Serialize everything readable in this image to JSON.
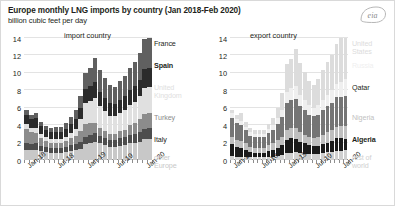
{
  "header": {
    "title": "Europe monthly LNG imports by country (Jan 2018-Feb 2020)",
    "subtitle": "billion cubic feet per day",
    "logo": "eia-logo"
  },
  "chart_data": [
    {
      "id": "imports",
      "type": "bar",
      "stacked": true,
      "title": "import country",
      "xlabel": "",
      "ylabel": "billion cubic feet per day",
      "ylim": [
        0,
        14
      ],
      "yticks": [
        0,
        2,
        4,
        6,
        8,
        10,
        12,
        14
      ],
      "grid": true,
      "legend_position": "right",
      "x": [
        "Jan-18",
        "Feb-18",
        "Mar-18",
        "Apr-18",
        "May-18",
        "Jun-18",
        "Jul-18",
        "Aug-18",
        "Sep-18",
        "Oct-18",
        "Nov-18",
        "Dec-18",
        "Jan-19",
        "Feb-19",
        "Mar-19",
        "Apr-19",
        "May-19",
        "Jun-19",
        "Jul-19",
        "Aug-19",
        "Sep-19",
        "Oct-19",
        "Nov-19",
        "Dec-19",
        "Jan-20",
        "Feb-20"
      ],
      "xtick_labels": [
        "Jan-18",
        "Jul-18",
        "Jan-19",
        "Jul-19",
        "Jan-20"
      ],
      "xtick_index": [
        0,
        6,
        12,
        18,
        24
      ],
      "series": [
        {
          "name": "other Europe",
          "color": "#c8c8c8",
          "values": [
            1.2,
            1.1,
            1.2,
            1.0,
            0.9,
            0.8,
            0.8,
            0.8,
            0.9,
            1.0,
            1.1,
            1.3,
            1.8,
            2.0,
            2.1,
            1.9,
            1.7,
            1.5,
            1.5,
            1.6,
            1.7,
            1.9,
            2.0,
            2.1,
            2.4,
            2.6
          ]
        },
        {
          "name": "Italy",
          "color": "#4d4d4d",
          "values": [
            0.8,
            0.7,
            0.7,
            0.6,
            0.6,
            0.6,
            0.6,
            0.6,
            0.6,
            0.7,
            0.7,
            0.8,
            0.9,
            0.9,
            1.0,
            0.9,
            0.8,
            0.8,
            0.8,
            0.9,
            0.9,
            1.0,
            1.0,
            1.1,
            1.2,
            1.3
          ]
        },
        {
          "name": "Turkey",
          "color": "#8c8c8c",
          "values": [
            1.6,
            1.4,
            1.2,
            0.9,
            0.7,
            0.6,
            0.6,
            0.6,
            0.7,
            0.8,
            1.0,
            1.2,
            1.4,
            1.3,
            1.2,
            0.9,
            0.8,
            0.7,
            0.7,
            0.8,
            0.9,
            1.1,
            1.3,
            1.5,
            1.7,
            1.8
          ]
        },
        {
          "name": "United Kingdom",
          "color": "#e0e0e0",
          "values": [
            0.5,
            0.5,
            0.6,
            0.5,
            0.4,
            0.4,
            0.4,
            0.4,
            0.5,
            0.6,
            0.8,
            1.4,
            2.4,
            2.6,
            2.8,
            2.5,
            2.3,
            2.1,
            2.0,
            2.1,
            2.2,
            2.3,
            2.4,
            2.6,
            3.0,
            3.2
          ]
        },
        {
          "name": "Spain",
          "color": "#2b2b2b",
          "values": [
            1.1,
            1.0,
            1.1,
            0.9,
            0.8,
            0.8,
            0.8,
            0.8,
            0.9,
            1.0,
            1.1,
            1.3,
            1.6,
            1.7,
            1.8,
            1.6,
            1.5,
            1.4,
            1.4,
            1.5,
            1.6,
            1.7,
            1.8,
            1.9,
            2.1,
            2.3
          ]
        },
        {
          "name": "France",
          "color": "#606060",
          "values": [
            0.6,
            0.5,
            0.6,
            0.5,
            0.5,
            0.5,
            0.6,
            0.6,
            0.7,
            0.8,
            1.0,
            1.3,
            1.9,
            2.1,
            2.8,
            2.5,
            2.3,
            2.1,
            2.0,
            2.2,
            2.4,
            2.6,
            2.8,
            3.1,
            3.5,
            3.7
          ]
        }
      ],
      "legend_entries": [
        "France",
        "Spain",
        "United Kingdom",
        "Turkey",
        "Italy",
        "other Europe"
      ]
    },
    {
      "id": "exports",
      "type": "bar",
      "stacked": true,
      "title": "export country",
      "xlabel": "",
      "ylabel": "billion cubic feet per day",
      "ylim": [
        0,
        14
      ],
      "yticks": [
        0,
        2,
        4,
        6,
        8,
        10,
        12,
        14
      ],
      "grid": true,
      "legend_position": "right",
      "x": [
        "Jan-18",
        "Feb-18",
        "Mar-18",
        "Apr-18",
        "May-18",
        "Jun-18",
        "Jul-18",
        "Aug-18",
        "Sep-18",
        "Oct-18",
        "Nov-18",
        "Dec-18",
        "Jan-19",
        "Feb-19",
        "Mar-19",
        "Apr-19",
        "May-19",
        "Jun-19",
        "Jul-19",
        "Aug-19",
        "Sep-19",
        "Oct-19",
        "Nov-19",
        "Dec-19",
        "Jan-20",
        "Feb-20"
      ],
      "xtick_labels": [
        "Jan-18",
        "Jul-18",
        "Jan-19",
        "Jul-19",
        "Jan-20"
      ],
      "xtick_index": [
        0,
        6,
        12,
        18,
        24
      ],
      "series": [
        {
          "name": "rest of world",
          "color": "#d0d0d0",
          "values": [
            0.5,
            0.4,
            0.4,
            0.4,
            0.3,
            0.3,
            0.3,
            0.3,
            0.4,
            0.4,
            0.5,
            0.6,
            0.8,
            0.8,
            0.9,
            0.8,
            0.7,
            0.7,
            0.7,
            0.7,
            0.8,
            0.9,
            0.9,
            1.0,
            1.1,
            1.2
          ]
        },
        {
          "name": "Algeria",
          "color": "#1a1a1a",
          "values": [
            1.3,
            1.1,
            1.0,
            0.8,
            0.6,
            0.5,
            0.5,
            0.5,
            0.6,
            0.7,
            0.9,
            1.1,
            1.5,
            1.7,
            1.5,
            1.3,
            1.2,
            1.0,
            0.9,
            0.9,
            1.0,
            1.1,
            1.3,
            1.5,
            1.6,
            1.4
          ]
        },
        {
          "name": "Nigeria",
          "color": "#bfbfbf",
          "values": [
            0.9,
            0.8,
            0.8,
            0.7,
            0.6,
            0.6,
            0.6,
            0.6,
            0.7,
            0.8,
            0.9,
            1.0,
            1.2,
            1.2,
            1.3,
            1.1,
            1.0,
            0.9,
            0.9,
            1.0,
            1.1,
            1.2,
            1.2,
            1.3,
            1.4,
            1.5
          ]
        },
        {
          "name": "Qatar",
          "color": "#757575",
          "values": [
            2.1,
            1.9,
            1.8,
            1.5,
            1.3,
            1.2,
            1.2,
            1.2,
            1.4,
            1.6,
            1.8,
            2.2,
            3.0,
            3.2,
            3.3,
            3.0,
            2.8,
            2.6,
            2.5,
            2.6,
            2.8,
            3.0,
            3.2,
            3.4,
            3.6,
            3.7
          ]
        },
        {
          "name": "Russia",
          "color": "#efefef",
          "values": [
            0.6,
            0.5,
            0.5,
            0.4,
            0.4,
            0.4,
            0.4,
            0.4,
            0.5,
            0.5,
            0.7,
            0.9,
            1.3,
            1.4,
            1.5,
            1.3,
            1.2,
            1.1,
            1.0,
            1.1,
            1.2,
            1.3,
            1.4,
            1.5,
            1.8,
            2.0
          ]
        },
        {
          "name": "United States",
          "color": "#dcdcdc",
          "values": [
            0.4,
            0.5,
            0.9,
            0.6,
            0.5,
            0.4,
            0.4,
            0.4,
            0.5,
            0.8,
            1.2,
            1.9,
            3.2,
            3.3,
            4.2,
            3.6,
            3.2,
            2.8,
            2.6,
            3.0,
            3.4,
            3.8,
            4.1,
            4.6,
            5.3,
            5.0
          ]
        }
      ],
      "legend_entries": [
        "United States",
        "Russia",
        "Qatar",
        "Nigeria",
        "Algeria",
        "rest of world"
      ]
    }
  ]
}
